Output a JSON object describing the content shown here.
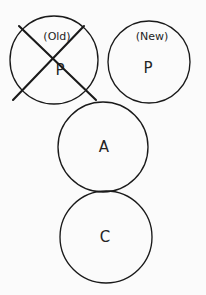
{
  "diagram": {
    "background_color": "#fbfbfb",
    "stroke_color": "#1a1a1a",
    "text_color": "#242424",
    "nodes": [
      {
        "id": "p-old",
        "label": "P",
        "tag": "(Old)",
        "struck_out": true,
        "cx": 54,
        "cy": 60,
        "r": 44,
        "label_x": 60,
        "label_y": 70,
        "tag_x": 57,
        "tag_y": 37
      },
      {
        "id": "p-new",
        "label": "P",
        "tag": "(New)",
        "struck_out": false,
        "cx": 149,
        "cy": 62,
        "r": 41,
        "label_x": 148,
        "label_y": 68,
        "tag_x": 152,
        "tag_y": 37
      },
      {
        "id": "a-node",
        "label": "A",
        "tag": "",
        "struck_out": false,
        "cx": 103,
        "cy": 147,
        "r": 45,
        "label_x": 104,
        "label_y": 147,
        "tag_x": 0,
        "tag_y": 0
      },
      {
        "id": "c-node",
        "label": "C",
        "tag": "",
        "struck_out": false,
        "cx": 106,
        "cy": 237,
        "r": 46,
        "label_x": 105,
        "label_y": 237,
        "tag_x": 0,
        "tag_y": 0
      }
    ],
    "strike_lines": [
      {
        "id": "strike-a",
        "x1": 19,
        "y1": 26,
        "x2": 96,
        "y2": 100
      },
      {
        "id": "strike-b",
        "x1": 84,
        "y1": 26,
        "x2": 13,
        "y2": 100
      }
    ]
  }
}
